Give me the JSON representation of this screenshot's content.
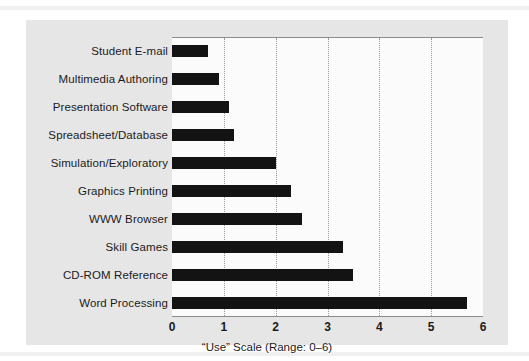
{
  "figure": {
    "panel_background": "#e6e6e6",
    "plot_background": "#fbfbfb",
    "bar_color": "#131313",
    "axis_color": "#8b8b8b",
    "gridline_color": "#9a9a9a"
  },
  "chart_data": {
    "type": "bar",
    "orientation": "horizontal",
    "title": "",
    "xlabel": "“Use” Scale (Range: 0–6)",
    "ylabel": "",
    "xlim": [
      0,
      6
    ],
    "xticks": [
      "0",
      "1",
      "2",
      "3",
      "4",
      "5",
      "6"
    ],
    "grid": "vertical-dotted",
    "legend": "none",
    "categories": [
      "Student E-mail",
      "Multimedia Authoring",
      "Presentation Software",
      "Spreadsheet/Database",
      "Simulation/Exploratory",
      "Graphics Printing",
      "WWW Browser",
      "Skill Games",
      "CD-ROM Reference",
      "Word Processing"
    ],
    "values": [
      0.7,
      0.9,
      1.1,
      1.2,
      2.0,
      2.3,
      2.5,
      3.3,
      3.5,
      5.7
    ]
  }
}
